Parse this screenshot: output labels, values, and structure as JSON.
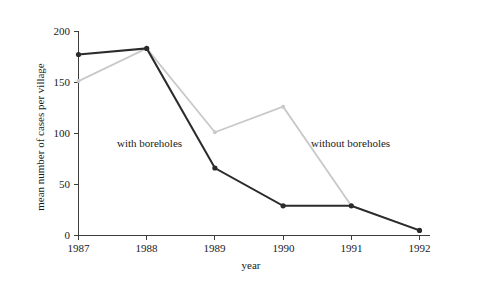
{
  "chart_data": {
    "type": "line",
    "title": "",
    "xlabel": "year",
    "ylabel": "mean number of cases per village",
    "categories": [
      "1987",
      "1988",
      "1989",
      "1990",
      "1991",
      "1992"
    ],
    "x": [
      1987,
      1988,
      1989,
      1990,
      1991,
      1992
    ],
    "xlim": [
      1987,
      1992
    ],
    "ylim": [
      0,
      200
    ],
    "yticks": [
      "0",
      "50",
      "100",
      "150",
      "200"
    ],
    "ytick_values": [
      0,
      50,
      100,
      150,
      200
    ],
    "grid": false,
    "legend_position": "inline-annotations",
    "series": [
      {
        "name": "with boreholes",
        "color": "#2b2b2b",
        "marker": "filled-circle",
        "values": [
          177,
          183,
          66,
          29,
          29,
          5
        ]
      },
      {
        "name": "without boreholes",
        "color": "#c9c9c9",
        "marker": "filled-circle",
        "values": [
          151,
          183,
          101,
          126,
          29,
          5
        ]
      }
    ],
    "annotations": [
      {
        "text": "with boreholes",
        "x": 1988.0,
        "y": 88
      },
      {
        "text": "without boreholes",
        "x": 1990.8,
        "y": 88
      }
    ]
  },
  "axes": {
    "y_label": "mean number of cases per village",
    "x_label": "year",
    "y_tick_0": "0",
    "y_tick_1": "50",
    "y_tick_2": "100",
    "y_tick_3": "150",
    "y_tick_4": "200",
    "x_tick_0": "1987",
    "x_tick_1": "1988",
    "x_tick_2": "1989",
    "x_tick_3": "1990",
    "x_tick_4": "1991",
    "x_tick_5": "1992"
  },
  "annotation_labels": {
    "with": "with boreholes",
    "without": "without boreholes"
  },
  "colors": {
    "dark_series": "#2b2b2b",
    "light_series": "#c9c9c9",
    "axis": "#3c3c3c",
    "text": "#1a1a1a",
    "background": "#ffffff"
  }
}
